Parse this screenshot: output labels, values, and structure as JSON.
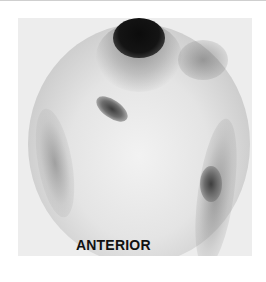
{
  "image": {
    "type": "scintigraphy-scan",
    "view_label": "ANTERIOR"
  }
}
